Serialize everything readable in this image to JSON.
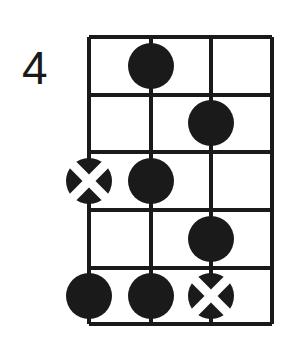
{
  "diagram": {
    "type": "guitar-chord-diagram",
    "position_label": "4",
    "strings": 4,
    "frets": 5,
    "colors": {
      "ink": "#1a1a1a",
      "paper": "#ffffff",
      "marker_fill": "#1a1a1a",
      "marker_x": "#ffffff"
    },
    "geometry": {
      "left": 89,
      "right": 272,
      "top": 37,
      "bottom": 324,
      "string_x": [
        89,
        151,
        211,
        272
      ],
      "fret_y": [
        37,
        95,
        152,
        210,
        268,
        324
      ],
      "space_center_y": [
        66,
        123,
        181,
        239,
        296
      ],
      "marker_radius": 23,
      "line_width": 4,
      "label_x": 22,
      "label_y": 84
    },
    "markers": [
      {
        "name": "marker-fret1-string2",
        "kind": "dot",
        "string": 2,
        "fret": 1,
        "cx": 151,
        "cy": 66
      },
      {
        "name": "marker-fret2-string3",
        "kind": "dot",
        "string": 3,
        "fret": 2,
        "cx": 211,
        "cy": 123
      },
      {
        "name": "marker-fret3-string1",
        "kind": "dot-x",
        "string": 1,
        "fret": 3,
        "cx": 89,
        "cy": 181
      },
      {
        "name": "marker-fret3-string2",
        "kind": "dot",
        "string": 2,
        "fret": 3,
        "cx": 151,
        "cy": 181
      },
      {
        "name": "marker-fret4-string3",
        "kind": "dot",
        "string": 3,
        "fret": 4,
        "cx": 211,
        "cy": 239
      },
      {
        "name": "marker-fret5-string1",
        "kind": "dot",
        "string": 1,
        "fret": 5,
        "cx": 89,
        "cy": 296
      },
      {
        "name": "marker-fret5-string2",
        "kind": "dot",
        "string": 2,
        "fret": 5,
        "cx": 151,
        "cy": 296
      },
      {
        "name": "marker-fret5-string3",
        "kind": "dot-x",
        "string": 3,
        "fret": 5,
        "cx": 211,
        "cy": 296
      }
    ]
  }
}
